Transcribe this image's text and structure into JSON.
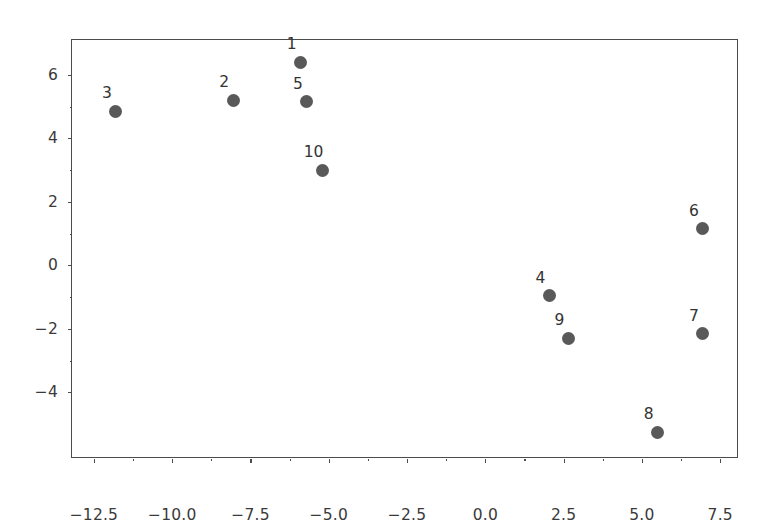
{
  "chart_data": {
    "type": "scatter",
    "title": "",
    "xlabel": "",
    "ylabel": "",
    "xlim": [
      -13.2,
      8.1
    ],
    "ylim": [
      -6.1,
      7.1
    ],
    "grid": false,
    "legend": null,
    "marker_color": "#595959",
    "marker_size": 13,
    "axis_color": "#4c4c4c",
    "background": "#ffffff",
    "xticks": [
      {
        "value": -12.5,
        "label": "−12.5"
      },
      {
        "value": -10.0,
        "label": "−10.0"
      },
      {
        "value": -7.5,
        "label": "−7.5"
      },
      {
        "value": -5.0,
        "label": "−5.0"
      },
      {
        "value": -2.5,
        "label": "−2.5"
      },
      {
        "value": 0.0,
        "label": "0.0"
      },
      {
        "value": 2.5,
        "label": "2.5"
      },
      {
        "value": 5.0,
        "label": "5.0"
      },
      {
        "value": 7.5,
        "label": "7.5"
      }
    ],
    "yticks": [
      {
        "value": 6,
        "label": "6"
      },
      {
        "value": 4,
        "label": "4"
      },
      {
        "value": 2,
        "label": "2"
      },
      {
        "value": 0,
        "label": "0"
      },
      {
        "value": -2,
        "label": "−2"
      },
      {
        "value": -4,
        "label": "−4"
      }
    ],
    "points": [
      {
        "label": "1",
        "x": -5.9,
        "y": 6.4
      },
      {
        "label": "2",
        "x": -8.05,
        "y": 5.2
      },
      {
        "label": "3",
        "x": -11.8,
        "y": 4.85
      },
      {
        "label": "4",
        "x": 2.05,
        "y": -0.95
      },
      {
        "label": "5",
        "x": -5.7,
        "y": 5.15
      },
      {
        "label": "6",
        "x": 6.95,
        "y": 1.15
      },
      {
        "label": "7",
        "x": 6.95,
        "y": -2.15
      },
      {
        "label": "8",
        "x": 5.5,
        "y": -5.25
      },
      {
        "label": "9",
        "x": 2.65,
        "y": -2.3
      },
      {
        "label": "10",
        "x": -5.2,
        "y": 3.0
      }
    ]
  }
}
